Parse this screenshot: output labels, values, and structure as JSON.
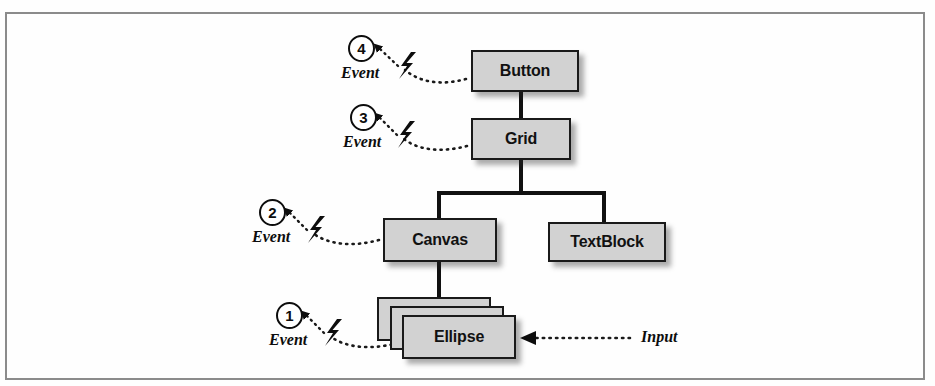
{
  "figure": {
    "background_color": "#fefefe",
    "frame_color": "#8b8b8b"
  },
  "style": {
    "box_fill": "#d2d2d2",
    "box_stroke": "#1a1a1a",
    "connector_color": "#111111",
    "dotted_color": "#1a1a1a"
  },
  "tree": {
    "nodes": [
      {
        "id": "button",
        "label": "Button",
        "x": 471,
        "y": 50,
        "w": 108,
        "h": 42
      },
      {
        "id": "grid",
        "label": "Grid",
        "x": 471,
        "y": 118,
        "w": 100,
        "h": 42
      },
      {
        "id": "canvas",
        "label": "Canvas",
        "x": 383,
        "y": 218,
        "w": 114,
        "h": 44
      },
      {
        "id": "textblock",
        "label": "TextBlock",
        "x": 548,
        "y": 222,
        "w": 118,
        "h": 40
      },
      {
        "id": "ellipse",
        "label": "Ellipse",
        "x": 402,
        "y": 315,
        "w": 114,
        "h": 44
      }
    ],
    "ellipse_stack_count": 3
  },
  "markers": [
    {
      "id": "marker-1",
      "number": "1",
      "event_label": "Event",
      "target": "ellipse",
      "x": 259,
      "y": 305,
      "label_x": 252,
      "label_y": 343
    },
    {
      "id": "marker-2",
      "number": "2",
      "event_label": "Event",
      "target": "canvas",
      "x": 259,
      "y": 205,
      "label_x": 252,
      "label_y": 243
    },
    {
      "id": "marker-3",
      "number": "3",
      "event_label": "Event",
      "target": "grid",
      "x": 350,
      "y": 125,
      "label_x": 343,
      "label_y": 163
    },
    {
      "id": "marker-4",
      "number": "4",
      "event_label": "Event",
      "target": "button",
      "x": 348,
      "y": 35,
      "label_x": 341,
      "label_y": 73
    }
  ],
  "input": {
    "label": "Input",
    "label_x": 641,
    "label_y": 332,
    "arrow_from_x": 630,
    "arrow_to_x": 522,
    "arrow_y": 338
  },
  "icons": {
    "lightning": "lightning-bolt-icon",
    "arrowhead": "arrowhead-icon"
  }
}
